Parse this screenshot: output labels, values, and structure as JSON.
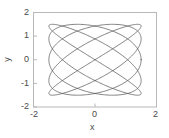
{
  "chart_data": {
    "type": "line",
    "title": "",
    "subtitle": "",
    "xlabel": "x",
    "ylabel": "y",
    "xlim": [
      -2,
      2
    ],
    "ylim": [
      -2,
      2
    ],
    "xticks": [
      -2,
      0,
      2
    ],
    "xticklabels": [
      "-2",
      "0",
      "2"
    ],
    "yticks": [
      -2,
      -1,
      0,
      1,
      2
    ],
    "yticklabels": [
      "-2",
      "-1",
      "0",
      "1",
      "2"
    ],
    "grid": false,
    "legend": null,
    "legend_position": "none",
    "frame": true,
    "line_color": "#4d4d4d",
    "line_width": 0.7,
    "background": "#ffffff",
    "series": [
      {
        "name": "lissajous",
        "description": "Lissajous figure, amplitude 1.5 in x and y, frequency ratio 5:4, phase offset pi/2",
        "parametric": {
          "x_expr": "1.5*sin(5*t + 1.5707963)",
          "y_expr": "1.5*sin(4*t)",
          "t_min": 0,
          "t_max": 6.2831853,
          "n_points": 1200
        },
        "x_amplitude": 1.5,
        "y_amplitude": 1.5,
        "x_freq": 5,
        "y_freq": 4,
        "phase": 1.5707963
      }
    ]
  },
  "axes": {
    "x_tick_0": "-2",
    "x_tick_1": "0",
    "x_tick_2": "2",
    "y_tick_0": "2",
    "y_tick_1": "1",
    "y_tick_2": "0",
    "y_tick_3": "-1",
    "y_tick_4": "-2",
    "x_axis_title": "x",
    "y_axis_title": "y"
  }
}
